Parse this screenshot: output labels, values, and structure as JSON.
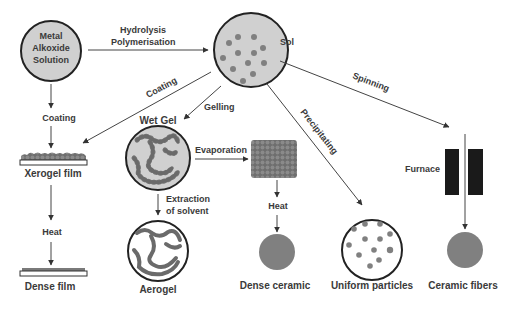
{
  "colors": {
    "circle_fill": "#d0d0d0",
    "particle": "#7a7a7a",
    "dense": "#808080",
    "outline": "#222222",
    "furnace": "#1a1a1a",
    "text": "#3a3a3a"
  },
  "nodes": {
    "metal_alkoxide": {
      "line1": "Metal",
      "line2": "Alkoxide",
      "line3": "Solution"
    },
    "sol": {
      "label": "Sol"
    },
    "wet_gel": {
      "label": "Wet Gel"
    },
    "xerogel_film": {
      "label": "Xerogel film"
    },
    "dense_film": {
      "label": "Dense film"
    },
    "aerogel": {
      "label": "Aerogel"
    },
    "dense_ceramic": {
      "label": "Dense ceramic"
    },
    "uniform_particles": {
      "label": "Uniform particles"
    },
    "ceramic_fibers": {
      "label": "Ceramic fibers"
    },
    "furnace": {
      "label": "Furnace"
    }
  },
  "edges": {
    "hydrolysis": {
      "line1": "Hydrolysis",
      "line2": "Polymerisation"
    },
    "coating_left": {
      "label": "Coating"
    },
    "coating_diag": {
      "label": "Coating"
    },
    "gelling": {
      "label": "Gelling"
    },
    "evaporation": {
      "label": "Evaporation"
    },
    "extraction": {
      "line1": "Extraction",
      "line2": "of solvent"
    },
    "heat_film": {
      "label": "Heat"
    },
    "heat_ceramic": {
      "label": "Heat"
    },
    "precipitating": {
      "label": "Precipitating"
    },
    "spinning": {
      "label": "Spinning"
    }
  }
}
